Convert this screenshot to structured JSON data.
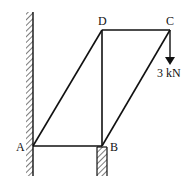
{
  "diagram": {
    "type": "truss",
    "nodes": {
      "A": {
        "label": "A",
        "x": 33,
        "y": 146
      },
      "B": {
        "label": "B",
        "x": 102,
        "y": 146
      },
      "C": {
        "label": "C",
        "x": 170,
        "y": 30
      },
      "D": {
        "label": "D",
        "x": 102,
        "y": 30
      }
    },
    "members": [
      [
        "A",
        "B"
      ],
      [
        "A",
        "D"
      ],
      [
        "D",
        "B"
      ],
      [
        "D",
        "C"
      ],
      [
        "C",
        "B"
      ]
    ],
    "load": {
      "node": "C",
      "label": "3 kN",
      "direction": "down"
    },
    "supports": [
      {
        "node": "A",
        "type": "wall",
        "label": "wall-support"
      },
      {
        "node": "B",
        "type": "pier",
        "label": "pier-support"
      }
    ]
  }
}
